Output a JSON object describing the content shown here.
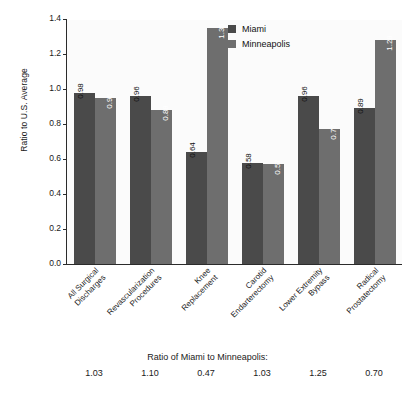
{
  "chart_data": {
    "type": "bar",
    "title": "",
    "xlabel": "",
    "ylabel": "Ratio to U.S. Average",
    "ylim": [
      0.0,
      1.4
    ],
    "yticks": [
      "0.0",
      "0.2",
      "0.4",
      "0.6",
      "0.8",
      "1.0",
      "1.2",
      "1.4"
    ],
    "ytick_values": [
      0.0,
      0.2,
      0.4,
      0.6,
      0.8,
      1.0,
      1.2,
      1.4
    ],
    "grid": false,
    "legend_position": "top-right",
    "categories": [
      "All Surgical Discharges",
      "Revascularization Procedures",
      "Knee Replacement",
      "Carotid Endarterectomy",
      "Lower Extremity Bypass",
      "Radical Prostatectomy"
    ],
    "category_lines": [
      [
        "All Surgical",
        "Discharges"
      ],
      [
        "Revascularization",
        "Procedures"
      ],
      [
        "Knee",
        "Replacement"
      ],
      [
        "Carotid",
        "Endarterectomy"
      ],
      [
        "Lower Extremity",
        "Bypass"
      ],
      [
        "Radical",
        "Prostatectomy"
      ]
    ],
    "series": [
      {
        "name": "Miami",
        "color": "#4a4a4a",
        "values": [
          0.98,
          0.96,
          0.64,
          0.58,
          0.96,
          0.89
        ],
        "labels": [
          "0.98",
          "0.96",
          "0.64",
          "0.58",
          "0.96",
          "0.89"
        ]
      },
      {
        "name": "Minneapolis",
        "color": "#6e6e6e",
        "values": [
          0.95,
          0.88,
          1.35,
          0.57,
          0.77,
          1.28
        ],
        "labels": [
          "0.95",
          "0.88",
          "1.35",
          "0.57",
          "0.77",
          "1.28"
        ]
      }
    ],
    "annotations": {
      "ratio_title": "Ratio of Miami to Minneapolis:",
      "ratio_values": [
        "1.03",
        "1.10",
        "0.47",
        "1.03",
        "1.25",
        "0.70"
      ]
    }
  },
  "legend": {
    "items": [
      {
        "label": "Miami",
        "color": "#4a4a4a"
      },
      {
        "label": "Minneapolis",
        "color": "#6e6e6e"
      }
    ]
  }
}
